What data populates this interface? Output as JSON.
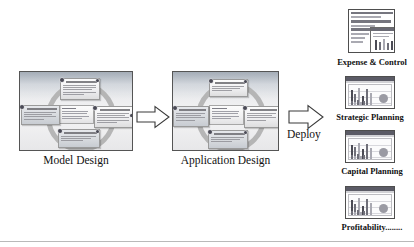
{
  "diagram": {
    "title_flow": "Model Design to Application Design to Deploy",
    "stages": [
      {
        "id": "model-design",
        "caption": "Model Design",
        "center_label": "",
        "nodes": 4
      },
      {
        "id": "application-design",
        "caption": "Application Design",
        "center_label": "",
        "nodes": 4
      }
    ],
    "arrows": [
      {
        "id": "arrow-model-to-application",
        "label": ""
      },
      {
        "id": "arrow-deploy",
        "label": "Deploy"
      }
    ],
    "deploy_label": "Deploy",
    "outputs": [
      {
        "id": "expense-and-control",
        "label": "Expense & Control",
        "thumb_type": "spreadsheet"
      },
      {
        "id": "strategic-planning",
        "label": "Strategic Planning",
        "thumb_type": "chart"
      },
      {
        "id": "capital-planning",
        "label": "Capital Planning",
        "thumb_type": "chart"
      },
      {
        "id": "profitability",
        "label": "Profitability........",
        "thumb_type": "chart"
      }
    ]
  },
  "colors": {
    "panel_border": "#555555",
    "thumb_border": "#4e4e4e",
    "ring": "#b2b2b2",
    "text": "#111111",
    "rule": "#b9b9b9"
  }
}
